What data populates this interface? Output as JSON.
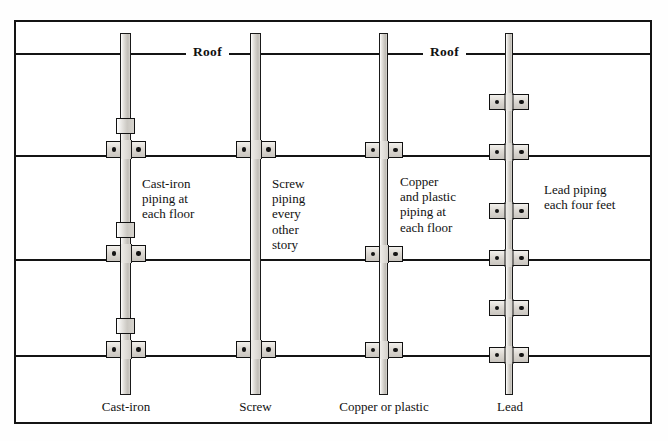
{
  "diagram": {
    "title_labels": {
      "roof_left": "Roof",
      "roof_right": "Roof"
    },
    "structure": {
      "floor_lines": [
        "roof",
        "floor-3",
        "floor-2",
        "floor-1"
      ],
      "frame_color": "#141414",
      "pipe_fill": "#cfccc6"
    },
    "columns": [
      {
        "id": "cast-iron",
        "caption": "Cast-iron",
        "note": "Cast-iron\npiping at\neach floor",
        "clamp_count": 4,
        "hub_count": 3,
        "pipe_width_px": 11
      },
      {
        "id": "screw",
        "caption": "Screw",
        "note": "Screw\npiping\nevery\nother\nstory",
        "clamp_count": 2,
        "hub_count": 0,
        "pipe_width_px": 11
      },
      {
        "id": "copper-or-plastic",
        "caption": "Copper or  plastic",
        "note": "Copper\nand plastic\npiping at\neach floor",
        "clamp_count": 3,
        "hub_count": 0,
        "pipe_width_px": 9
      },
      {
        "id": "lead",
        "caption": "Lead",
        "note": "Lead piping\neach four feet",
        "clamp_count": 6,
        "hub_count": 0,
        "pipe_width_px": 7
      }
    ]
  }
}
